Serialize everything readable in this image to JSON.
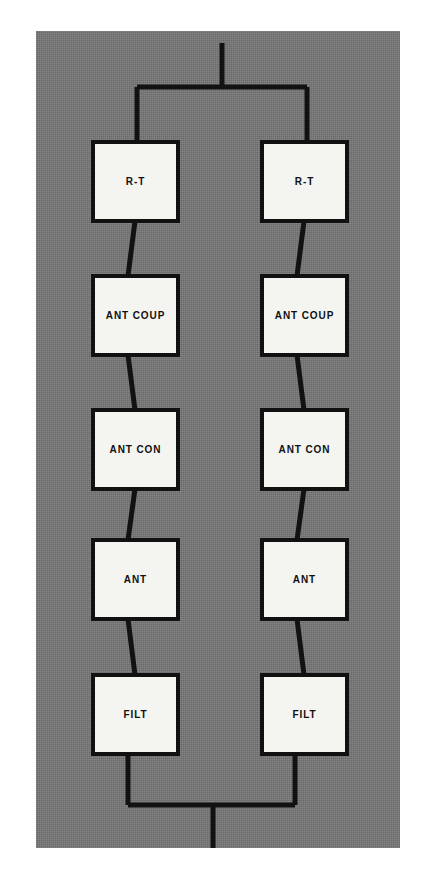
{
  "figure": {
    "kind": "block-diagram",
    "title_text": "",
    "panel": {
      "x": 36,
      "y": 31,
      "width": 364,
      "height": 817,
      "fill_color": "#757575"
    },
    "colors": {
      "background": "#ffffff",
      "panel_gray": "#757575",
      "block_fill": "#f4f4f1",
      "line": "#121212"
    }
  },
  "branches": [
    {
      "name": "left-branch",
      "center_x": 135,
      "blocks": [
        {
          "id": "left-rt",
          "label": "R-T",
          "x": 93,
          "y": 142,
          "w": 85,
          "h": 79
        },
        {
          "id": "left-ant-coup",
          "label": "ANT COUP",
          "x": 93,
          "y": 276,
          "w": 85,
          "h": 79
        },
        {
          "id": "left-ant-con",
          "label": "ANT CON",
          "x": 93,
          "y": 410,
          "w": 85,
          "h": 79
        },
        {
          "id": "left-ant",
          "label": "ANT",
          "x": 93,
          "y": 540,
          "w": 85,
          "h": 79
        },
        {
          "id": "left-filt",
          "label": "FILT",
          "x": 93,
          "y": 675,
          "w": 85,
          "h": 79
        }
      ]
    },
    {
      "name": "right-branch",
      "center_x": 304,
      "blocks": [
        {
          "id": "right-rt",
          "label": "R-T",
          "x": 262,
          "y": 142,
          "w": 85,
          "h": 79
        },
        {
          "id": "right-ant-coup",
          "label": "ANT COUP",
          "x": 262,
          "y": 276,
          "w": 85,
          "h": 79
        },
        {
          "id": "right-ant-con",
          "label": "ANT CON",
          "x": 262,
          "y": 410,
          "w": 85,
          "h": 79
        },
        {
          "id": "right-ant",
          "label": "ANT",
          "x": 262,
          "y": 540,
          "w": 85,
          "h": 79
        },
        {
          "id": "right-filt",
          "label": "FILT",
          "x": 262,
          "y": 675,
          "w": 85,
          "h": 79
        }
      ]
    }
  ],
  "buses": {
    "top": {
      "name": "top-bus",
      "stem_x": 222,
      "stem_top_y": 43,
      "bus_y": 87,
      "left_x": 137,
      "right_x": 307,
      "drop_to_y": 142
    },
    "bottom": {
      "name": "bottom-bus",
      "stem_x": 213,
      "stem_bottom_y": 848,
      "bus_y": 805,
      "left_x": 128,
      "right_x": 295,
      "rise_from_y": 754
    }
  },
  "connectors": [
    {
      "id": "left-rt-to-ant-coup",
      "x1": 135,
      "y1": 221,
      "x2": 128,
      "y2": 276
    },
    {
      "id": "left-ant-coup-to-ant-con",
      "x1": 128,
      "y1": 355,
      "x2": 135,
      "y2": 410
    },
    {
      "id": "left-ant-con-to-ant",
      "x1": 135,
      "y1": 489,
      "x2": 128,
      "y2": 540
    },
    {
      "id": "left-ant-to-filt",
      "x1": 128,
      "y1": 619,
      "x2": 135,
      "y2": 675
    },
    {
      "id": "right-rt-to-ant-coup",
      "x1": 304,
      "y1": 221,
      "x2": 297,
      "y2": 276
    },
    {
      "id": "right-ant-coup-to-ant-con",
      "x1": 297,
      "y1": 355,
      "x2": 304,
      "y2": 410
    },
    {
      "id": "right-ant-con-to-ant",
      "x1": 304,
      "y1": 489,
      "x2": 297,
      "y2": 540
    },
    {
      "id": "right-ant-to-filt",
      "x1": 297,
      "y1": 619,
      "x2": 304,
      "y2": 675
    }
  ]
}
